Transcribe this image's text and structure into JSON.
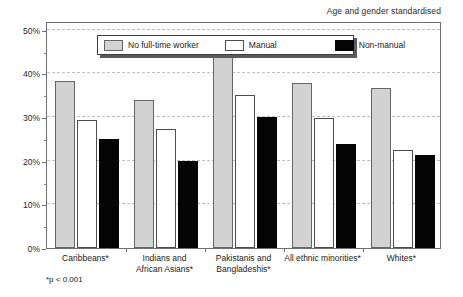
{
  "caption": {
    "top_right": "Age and gender standardised",
    "footnote": "*p < 0.001"
  },
  "legend": {
    "position": "inside-top-center",
    "entries": [
      {
        "label": "No full-time worker",
        "color": "#d2d2d2",
        "key": "nofulltime"
      },
      {
        "label": "Manual",
        "color": "#ffffff",
        "key": "manual"
      },
      {
        "label": "Non-manual",
        "color": "#050505",
        "key": "nonmanual"
      }
    ]
  },
  "axis": {
    "y_ticks": [
      "0%",
      "10%",
      "20%",
      "30%",
      "40%",
      "50%"
    ],
    "y_tick_values": [
      0,
      10,
      20,
      30,
      40,
      50
    ],
    "y_minor_values": [
      5,
      15,
      25,
      35,
      45
    ],
    "x_categories": [
      "Caribbeans*",
      "Indians and\nAfrican Asians*",
      "Pakistanis and\nBangladeshis*",
      "All ethnic minorities*",
      "Whites*"
    ]
  },
  "chart_data": {
    "type": "bar",
    "title": "",
    "subtitle": "",
    "annotations": [
      "Age and gender standardised",
      "*p < 0.001"
    ],
    "categories": [
      "Caribbeans*",
      "Indians and African Asians*",
      "Pakistanis and Bangladeshis*",
      "All ethnic minorities*",
      "Whites*"
    ],
    "series": [
      {
        "name": "No full-time worker",
        "color": "#d2d2d2",
        "values": [
          38.2,
          33.9,
          44.1,
          37.7,
          36.6
        ]
      },
      {
        "name": "Manual",
        "color": "#ffffff",
        "values": [
          29.4,
          27.3,
          35.0,
          29.7,
          22.5
        ]
      },
      {
        "name": "Non-manual",
        "color": "#050505",
        "values": [
          24.9,
          19.9,
          30.1,
          23.9,
          21.3
        ]
      }
    ],
    "xlabel": "",
    "ylabel": "",
    "ylim": [
      0,
      52
    ],
    "ytick_step": 10,
    "ytick_format": "percent",
    "grid": true,
    "grid_axis": "y",
    "grid_style": "dashed",
    "legend_position": "upper center"
  }
}
